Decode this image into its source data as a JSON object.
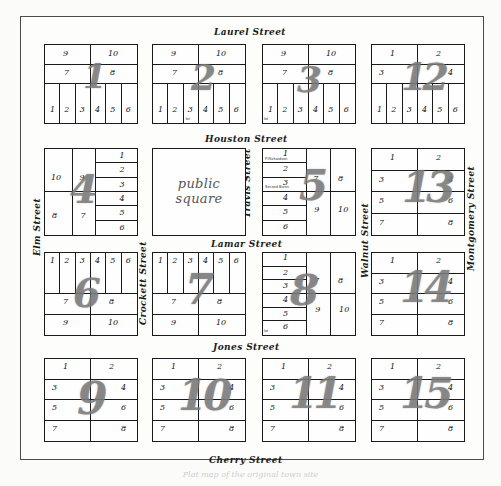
{
  "document": {
    "kind": "historic-town-plat-map",
    "caption": "Plat map of the original town site"
  },
  "public_square": {
    "label_line1": "public",
    "label_line2": "square"
  },
  "streets": {
    "horizontal": [
      {
        "name": "Laurel Street"
      },
      {
        "name": "Houston Street"
      },
      {
        "name": "Lamar Street"
      },
      {
        "name": "Jones Street"
      },
      {
        "name": "Cherry Street"
      }
    ],
    "vertical": [
      {
        "name": "Elm Street"
      },
      {
        "name": "Crockett Street"
      },
      {
        "name": "Travis Street"
      },
      {
        "name": "Walnut Street"
      },
      {
        "name": "Montgomery Street"
      }
    ]
  },
  "blocks": [
    {
      "number": "1",
      "lots": [
        "9",
        "10",
        "7",
        "8",
        "1",
        "2",
        "3",
        "4",
        "5",
        "6"
      ],
      "annotations": []
    },
    {
      "number": "2",
      "lots": [
        "9",
        "10",
        "7",
        "8",
        "1",
        "2",
        "3",
        "4",
        "5",
        "6"
      ],
      "annotations": [
        "lot"
      ]
    },
    {
      "number": "3",
      "lots": [
        "9",
        "10",
        "7",
        "8",
        "1",
        "2",
        "3",
        "4",
        "5",
        "6"
      ],
      "annotations": [
        "lot"
      ]
    },
    {
      "number": "12",
      "lots": [
        "1",
        "2",
        "3",
        "4",
        "1",
        "2",
        "3",
        "4",
        "5",
        "6"
      ],
      "annotations": []
    },
    {
      "number": "4",
      "lots": [
        "10",
        "9",
        "8",
        "7",
        "1",
        "2",
        "3",
        "4",
        "5",
        "6"
      ],
      "annotations": []
    },
    {
      "number": "5",
      "lots": [
        "1",
        "2",
        "3",
        "4",
        "5",
        "6",
        "7",
        "8",
        "9",
        "10"
      ],
      "annotations": [
        "P.Richardson",
        "Second Burns"
      ]
    },
    {
      "number": "13",
      "lots": [
        "1",
        "2",
        "3",
        "4",
        "5",
        "6",
        "7",
        "8"
      ],
      "annotations": []
    },
    {
      "number": "6",
      "lots": [
        "1",
        "2",
        "3",
        "4",
        "5",
        "6",
        "7",
        "8",
        "9",
        "10"
      ],
      "annotations": []
    },
    {
      "number": "7",
      "lots": [
        "1",
        "2",
        "3",
        "4",
        "5",
        "6",
        "7",
        "8",
        "9",
        "10"
      ],
      "annotations": []
    },
    {
      "number": "8",
      "lots": [
        "1",
        "2",
        "3",
        "4",
        "5",
        "6",
        "7",
        "8",
        "9",
        "10"
      ],
      "annotations": [
        "lot"
      ]
    },
    {
      "number": "14",
      "lots": [
        "1",
        "2",
        "3",
        "4",
        "5",
        "6",
        "7",
        "8"
      ],
      "annotations": []
    },
    {
      "number": "9",
      "lots": [
        "1",
        "2",
        "3",
        "4",
        "5",
        "6",
        "7",
        "8"
      ],
      "annotations": []
    },
    {
      "number": "10",
      "lots": [
        "1",
        "2",
        "3",
        "4",
        "5",
        "6",
        "7",
        "8"
      ],
      "annotations": []
    },
    {
      "number": "11",
      "lots": [
        "1",
        "2",
        "3",
        "4",
        "5",
        "6",
        "7",
        "8"
      ],
      "annotations": []
    },
    {
      "number": "15",
      "lots": [
        "1",
        "2",
        "3",
        "4",
        "5",
        "6",
        "7",
        "8"
      ],
      "annotations": []
    }
  ]
}
